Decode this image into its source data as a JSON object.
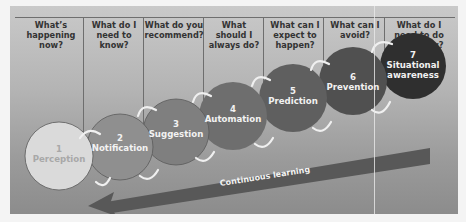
{
  "questions": [
    {
      "text": "What’s happening now?"
    },
    {
      "text": "What do I need to know?"
    },
    {
      "text": "What do you recommend?"
    },
    {
      "text": "What should I always do?"
    },
    {
      "text": "What can I expect to happen?"
    },
    {
      "text": "What can I avoid?"
    },
    {
      "text": "What do I need to do right now?"
    }
  ],
  "stages": [
    {
      "number": "1",
      "label": "Perception",
      "color": "#d9d9d9",
      "text_color": "#a6a6a6"
    },
    {
      "number": "2",
      "label": "Notification",
      "color": "#8f8f8f",
      "text_color": "#f2f2f2"
    },
    {
      "number": "3",
      "label": "Suggestion",
      "color": "#7c7c7c",
      "text_color": "#f2f2f2"
    },
    {
      "number": "4",
      "label": "Automation",
      "color": "#6c6c6c",
      "text_color": "#f2f2f2"
    },
    {
      "number": "5",
      "label": "Prediction",
      "color": "#5c5c5c",
      "text_color": "#f2f2f2"
    },
    {
      "number": "6",
      "label": "Prevention",
      "color": "#4e4e4e",
      "text_color": "#f2f2f2"
    },
    {
      "number": "7",
      "label": "Situational awareness",
      "color": "#2e2e2e",
      "text_color": "#f2f2f2"
    }
  ],
  "arrow": {
    "label": "Continuous learning",
    "color": "#555555"
  },
  "colors": {
    "background_top": "#c9c9c9",
    "background_bottom": "#8c8c8c",
    "arc_color": "#f0f0f0"
  }
}
